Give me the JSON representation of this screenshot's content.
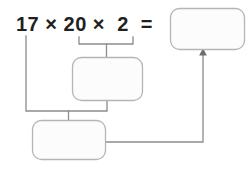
{
  "page": {
    "type": "math-worksheet-diagram",
    "width": 249,
    "height": 170,
    "background_color": "#ffffff"
  },
  "expression": {
    "full_text": "17 × 20 ×  2  =",
    "terms": [
      "17",
      "20",
      "2"
    ],
    "operators": [
      "×",
      "×"
    ],
    "equals_sign": "=",
    "text_color": "#231f20"
  },
  "boxes": [
    {
      "id": "result-box",
      "name": "final-answer-box",
      "value": "",
      "placeholder": "",
      "x": 170,
      "y": 8,
      "width": 74,
      "height": 41,
      "stroke_color": "#b5b5b5",
      "fill_color": "#fcfcfc",
      "radius": 9
    },
    {
      "id": "partial-box",
      "name": "partial-product-box",
      "value": "",
      "placeholder": "",
      "x": 72,
      "y": 57,
      "width": 70,
      "height": 43,
      "stroke_color": "#b5b5b5",
      "fill_color": "#fcfcfc",
      "radius": 9
    },
    {
      "id": "combined-box",
      "name": "combined-product-box",
      "value": "",
      "placeholder": "",
      "x": 32,
      "y": 120,
      "width": 73,
      "height": 39,
      "stroke_color": "#b5b5b5",
      "fill_color": "#fcfcfc",
      "radius": 9
    }
  ],
  "connectors": [
    {
      "id": "grouping-bracket-upper",
      "name": "bracket-20-times-2",
      "description": "bracket grouping 20 and 2 down into the partial-product box",
      "color": "#8c8c8c"
    },
    {
      "id": "grouping-bracket-lower",
      "name": "bracket-17-times-partial",
      "description": "bracket joining 17 and the partial-product box down into the combined-product box",
      "color": "#8c8c8c"
    },
    {
      "id": "result-arrow",
      "name": "arrow-to-final-answer",
      "description": "arrow from the combined-product box up into the final answer box",
      "color": "#8c8c8c",
      "has_arrowhead": true
    }
  ],
  "colors": {
    "ink": "#231f20",
    "line": "#8c8c8c",
    "box_stroke": "#b5b5b5",
    "box_fill": "#fcfcfc",
    "background": "#ffffff"
  }
}
